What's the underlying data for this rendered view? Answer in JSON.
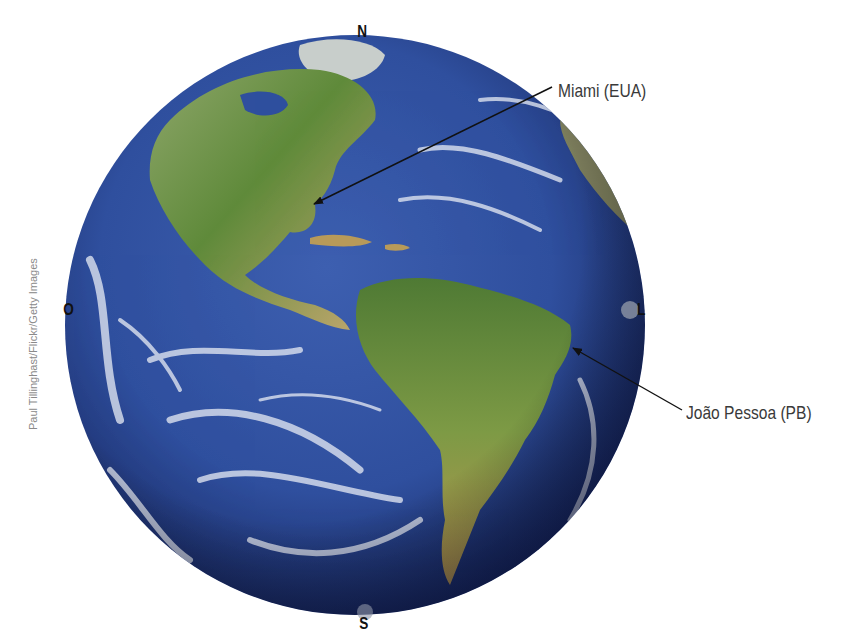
{
  "figure": {
    "compass": {
      "north": "N",
      "south": "S",
      "west": "O",
      "east": "L"
    },
    "annotations": [
      {
        "label": "Miami (EUA)",
        "target": "Florida, USA"
      },
      {
        "label": "João Pessoa (PB)",
        "target": "Eastern tip of Brazil"
      }
    ],
    "credit": "Paul Tillinghast/Flickr/Getty Images",
    "colors": {
      "ocean": "#2f4f9e",
      "ocean_dark": "#1b2c6b",
      "land_green": "#5f8a3a",
      "land_brown": "#b59a5a",
      "cloud": "#e8ecf5",
      "arrow": "#111111",
      "label_text": "#3a3a3a"
    }
  }
}
